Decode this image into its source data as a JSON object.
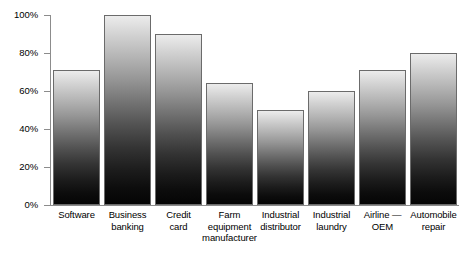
{
  "chart_data": {
    "type": "bar",
    "title": "",
    "xlabel": "",
    "ylabel": "",
    "ylim": [
      0,
      100
    ],
    "y_tick_labels": [
      "0%",
      "20%",
      "40%",
      "60%",
      "80%",
      "100%"
    ],
    "y_ticks": [
      0,
      20,
      40,
      60,
      80,
      100
    ],
    "grid": false,
    "legend": null,
    "categories": [
      "Software",
      "Business banking",
      "Credit card",
      "Farm equipment manufacturer",
      "Industrial distributor",
      "Industrial laundry",
      "Airline — OEM",
      "Automobile repair"
    ],
    "category_lines": [
      [
        "Software"
      ],
      [
        "Business",
        "banking"
      ],
      [
        "Credit",
        "card"
      ],
      [
        "Farm",
        "equipment",
        "manufacturer"
      ],
      [
        "Industrial",
        "distributor"
      ],
      [
        "Industrial",
        "laundry"
      ],
      [
        "Airline —",
        "OEM"
      ],
      [
        "Automobile",
        "repair"
      ]
    ],
    "values": [
      71,
      100,
      90,
      64,
      50,
      60,
      71,
      80
    ],
    "bar_style": {
      "gradient_top_color": "#ececec",
      "gradient_bottom_color": "#050505",
      "border_color": "#6b6b6b"
    },
    "axis_color": "#8c8c8c",
    "background_color": "#ffffff"
  }
}
